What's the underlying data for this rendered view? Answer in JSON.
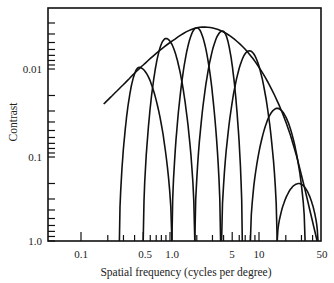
{
  "chart_data": {
    "type": "line",
    "title": "",
    "xlabel": "Spatial frequency (cycles per degree)",
    "ylabel": "Contrast",
    "xscale": "log",
    "yscale": "log",
    "y_inverted": true,
    "xlim": [
      0.04,
      50
    ],
    "ylim": [
      1.0,
      0.0017
    ],
    "grid": false,
    "legend": null,
    "x_ticks": [
      {
        "value": 0.1,
        "label": "0.1"
      },
      {
        "value": 0.5,
        "label": "0.5"
      },
      {
        "value": 1.0,
        "label": "1.0"
      },
      {
        "value": 5,
        "label": "5"
      },
      {
        "value": 10,
        "label": "10"
      },
      {
        "value": 50,
        "label": "50"
      }
    ],
    "y_ticks": [
      {
        "value": 0.01,
        "label": "0.01"
      },
      {
        "value": 0.1,
        "label": "0.1"
      },
      {
        "value": 1.0,
        "label": "1.0"
      }
    ],
    "series": [
      {
        "name": "envelope (overall CSF)",
        "x": [
          0.18,
          0.3,
          0.5,
          1.0,
          2.0,
          4.0,
          8.0,
          15,
          25,
          45
        ],
        "y": [
          0.025,
          0.015,
          0.009,
          0.005,
          0.0034,
          0.0038,
          0.007,
          0.02,
          0.08,
          0.9
        ]
      },
      {
        "name": "channel 1",
        "peak_x": 0.45,
        "peak_y": 0.0096,
        "base_low": 0.27,
        "base_high": 1.05
      },
      {
        "name": "channel 2",
        "peak_x": 0.9,
        "peak_y": 0.0045,
        "base_low": 0.5,
        "base_high": 1.9
      },
      {
        "name": "channel 3",
        "peak_x": 2.0,
        "peak_y": 0.0034,
        "base_low": 1.05,
        "base_high": 3.7
      },
      {
        "name": "channel 4",
        "peak_x": 3.9,
        "peak_y": 0.0037,
        "base_low": 1.9,
        "base_high": 6.5
      },
      {
        "name": "channel 5",
        "peak_x": 7.8,
        "peak_y": 0.0062,
        "base_low": 3.8,
        "base_high": 16
      },
      {
        "name": "channel 6",
        "peak_x": 16,
        "peak_y": 0.028,
        "base_low": 8,
        "base_high": 33
      },
      {
        "name": "channel 7",
        "peak_x": 28,
        "peak_y": 0.2,
        "base_low": 16,
        "base_high": 46
      }
    ]
  },
  "labels": {
    "ylabel": "Contrast",
    "xlabel": "Spatial frequency (cycles per degree)",
    "y_tick_001": "0.01",
    "y_tick_01": "0.1",
    "y_tick_1": "1.0",
    "x_tick_01": "0.1",
    "x_tick_05": "0.5",
    "x_tick_1": "1.0",
    "x_tick_5": "5",
    "x_tick_10": "10",
    "x_tick_50": "50"
  }
}
